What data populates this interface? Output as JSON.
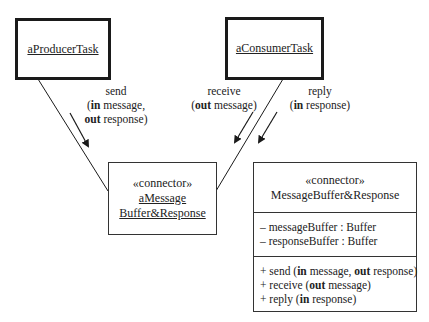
{
  "diagram": {
    "type": "UML communication diagram with connector class",
    "producer": {
      "label": "aProducerTask"
    },
    "consumer": {
      "label": "aConsumerTask"
    },
    "connector_instance": {
      "stereotype": "«connector»",
      "name_line1": "aMessage",
      "name_line2": "Buffer&Response"
    },
    "messages": {
      "send": {
        "line1": "send",
        "line2_kw": "in",
        "line2_rest": " message,",
        "line3_kw": "out",
        "line3_rest": " response)",
        "open_paren": "("
      },
      "receive": {
        "line1": "receive",
        "open_paren": "(",
        "kw": "out",
        "rest": " message)"
      },
      "reply": {
        "line1": "reply",
        "open_paren": "(",
        "kw": "in",
        "rest": " response)"
      }
    },
    "connector_class": {
      "stereotype": "«connector»",
      "name": "MessageBuffer&Response",
      "attributes": [
        "– messageBuffer : Buffer",
        "– responseBuffer : Buffer"
      ],
      "operations": [
        {
          "prefix": "+ send (",
          "kw1": "in",
          "mid": " message, ",
          "kw2": "out",
          "suffix": " response)"
        },
        {
          "prefix": "+ receive (",
          "kw1": "out",
          "suffix": " message)"
        },
        {
          "prefix": "+ reply (",
          "kw1": "in",
          "suffix": " response)"
        }
      ]
    },
    "colors": {
      "line": "#1a1a1a",
      "background": "#ffffff"
    }
  }
}
